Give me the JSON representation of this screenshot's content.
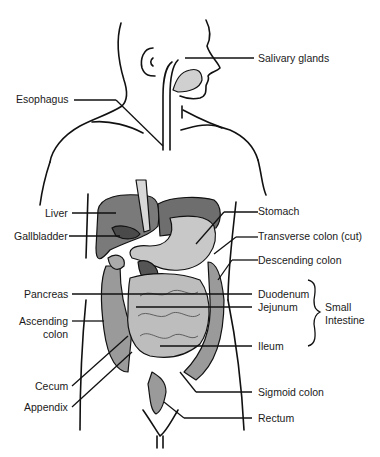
{
  "diagram": {
    "colors": {
      "outline": "#111111",
      "liver": "#7a7a7a",
      "gallbladder": "#4a4a4a",
      "stomach_dark": "#6e6e6e",
      "stomach_light": "#c8c8c8",
      "intestine": "#bdbdbd",
      "colon": "#9a9a9a",
      "pancreas": "#555555",
      "background": "#ffffff"
    },
    "labels_left": [
      {
        "id": "esophagus",
        "text": "Esophagus"
      },
      {
        "id": "liver",
        "text": "Liver"
      },
      {
        "id": "gallbladder",
        "text": "Gallbladder"
      },
      {
        "id": "pancreas",
        "text": "Pancreas"
      },
      {
        "id": "ascending_colon_1",
        "text": "Ascending"
      },
      {
        "id": "ascending_colon_2",
        "text": "colon"
      },
      {
        "id": "cecum",
        "text": "Cecum"
      },
      {
        "id": "appendix",
        "text": "Appendix"
      }
    ],
    "labels_right": [
      {
        "id": "salivary_glands",
        "text": "Salivary glands"
      },
      {
        "id": "stomach",
        "text": "Stomach"
      },
      {
        "id": "transverse_colon",
        "text": "Transverse colon (cut)"
      },
      {
        "id": "descending_colon",
        "text": "Descending colon"
      },
      {
        "id": "duodenum",
        "text": "Duodenum"
      },
      {
        "id": "jejunum",
        "text": "Jejunum"
      },
      {
        "id": "ileum",
        "text": "Ileum"
      },
      {
        "id": "sigmoid_colon",
        "text": "Sigmoid colon"
      },
      {
        "id": "rectum",
        "text": "Rectum"
      }
    ],
    "group_label": {
      "line1": "Small",
      "line2": "Intestine"
    }
  }
}
